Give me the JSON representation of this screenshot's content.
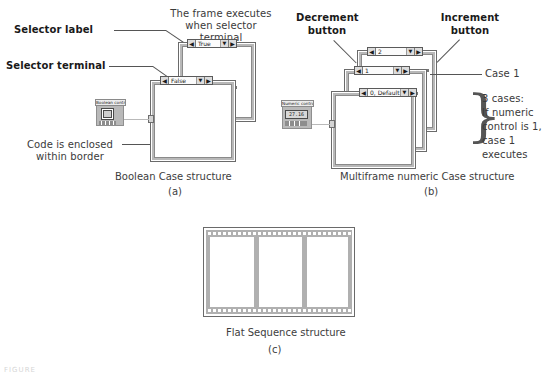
{
  "figure": {
    "panels": [
      {
        "id": "a",
        "caption": "Boolean Case structure",
        "sub": "(a)",
        "annotations": [
          {
            "name": "selector-label",
            "text": "Selector label"
          },
          {
            "name": "selector-terminal",
            "text": "Selector terminal"
          },
          {
            "name": "frame-executes",
            "text": "The frame executes\nwhen selector terminal\nis True"
          },
          {
            "name": "code-enclosed",
            "text": "Code is enclosed\nwithin border"
          }
        ],
        "control": {
          "label": "Boolean control",
          "value": ""
        },
        "cases": [
          {
            "label": "True",
            "dec": "◀",
            "inc": "▶",
            "drop": "▼"
          },
          {
            "label": "False",
            "dec": "◀",
            "inc": "▶",
            "drop": "▼"
          }
        ]
      },
      {
        "id": "b",
        "caption": "Multiframe numeric Case structure",
        "sub": "(b)",
        "annotations": [
          {
            "name": "decrement-button",
            "text": "Decrement\nbutton"
          },
          {
            "name": "increment-button",
            "text": "Increment\nbutton"
          },
          {
            "name": "case-1",
            "text": "Case 1"
          },
          {
            "name": "three-cases",
            "text": "3 cases:\nIf numeric\ncontrol is 1,\ncase 1 executes"
          }
        ],
        "control": {
          "label": "Numeric control",
          "value": "27.16"
        },
        "cases": [
          {
            "label": "2",
            "dec": "◀",
            "inc": "▶",
            "drop": "▼"
          },
          {
            "label": "1",
            "dec": "◀",
            "inc": "▶",
            "drop": "▼"
          },
          {
            "label": "0, Default",
            "dec": "◀",
            "inc": "▶",
            "drop": "▼"
          }
        ]
      },
      {
        "id": "c",
        "caption": "Flat Sequence structure",
        "sub": "(c)",
        "frames": 3
      }
    ],
    "footer": "FIGURE",
    "colors": {
      "ink": "#2b2b2b",
      "frame_border": "#6a6a6a",
      "frame_band": "#b8b8b8",
      "control_gray": "#b9b9b9",
      "wire_gray": "#b9b9b9",
      "rail_gray": "#b0b0b0",
      "background": "#ffffff"
    }
  }
}
